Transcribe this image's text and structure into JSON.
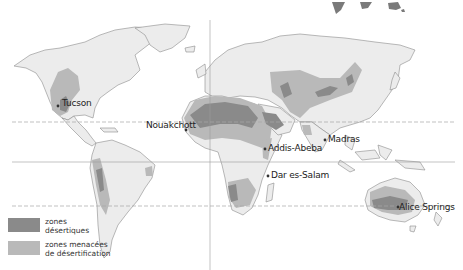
{
  "map": {
    "title": "",
    "colors": {
      "land": "#ececec",
      "threatened": "#b9b9b9",
      "desert": "#8a8a8a",
      "coastline": "#8c8c8c",
      "gridline": "#9a9a9a"
    },
    "cities": [
      {
        "name": "Tucson",
        "x": 58,
        "y": 105
      },
      {
        "name": "Nouakchott",
        "x": 188,
        "y": 129
      },
      {
        "name": "Addis-Abeba",
        "x": 263,
        "y": 148
      },
      {
        "name": "Madras",
        "x": 325,
        "y": 139
      },
      {
        "name": "Dar es-Salam",
        "x": 266,
        "y": 175
      },
      {
        "name": "Alice Springs",
        "x": 400,
        "y": 208
      }
    ],
    "reference_lines": {
      "meridian_x": 210,
      "equator_y": 162,
      "tropic_cancer_y": 122,
      "tropic_capricorn_y": 206
    }
  },
  "legend": {
    "items": [
      {
        "label": "zones désertiques",
        "line1": "zones",
        "line2": "désertiques",
        "color": "#8a8a8a"
      },
      {
        "label": "zones menacées de désertification",
        "line1": "zones menacées",
        "line2": "de désertification",
        "color": "#b9b9b9"
      }
    ]
  }
}
